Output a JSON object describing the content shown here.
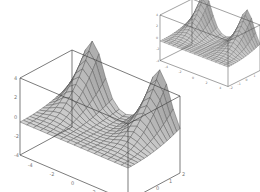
{
  "chart_data": [
    {
      "type": "surface3d",
      "title": "",
      "xlabel": "",
      "ylabel": "",
      "zlabel": "",
      "x_ticks": [
        "-4",
        "-2",
        "0",
        "2",
        "4"
      ],
      "y_ticks": [
        "-2",
        "-1",
        "0",
        "1",
        "2"
      ],
      "z_ticks": [
        "4",
        "2",
        "0",
        "-2",
        "-4"
      ],
      "xlim": [
        -5,
        5
      ],
      "ylim": [
        -2,
        2
      ],
      "zlim": [
        -4,
        4
      ],
      "grid": false,
      "description": "Gray meshed surface with two tall peaks along the back edge and a curved valley between them, flat plane in front",
      "mesh_color": "#555555",
      "face_color": "#cfcfcf",
      "box_color": "#444444"
    },
    {
      "type": "surface3d",
      "title": "",
      "x_ticks": [
        "-4",
        "-2",
        "0",
        "2",
        "4"
      ],
      "y_ticks": [
        "-2",
        "-1",
        "0",
        "1",
        "2"
      ],
      "z_ticks": [
        "4",
        "2",
        "0",
        "-2",
        "-4"
      ],
      "xlim": [
        -5,
        5
      ],
      "ylim": [
        -2,
        2
      ],
      "zlim": [
        -4,
        4
      ],
      "grid": false,
      "description": "Smaller copy of the same surface plot (upper right)",
      "mesh_color": "#555555",
      "face_color": "#cfcfcf",
      "box_color": "#444444"
    }
  ]
}
